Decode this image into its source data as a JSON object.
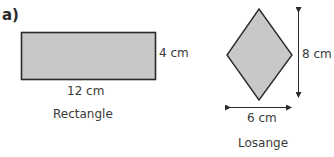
{
  "part_label": "a)",
  "colors": {
    "fill": "#c8c8c8",
    "stroke": "#2b2b2b",
    "text": "#3a3a3a"
  },
  "rectangle": {
    "name": "Rectangle",
    "width_label": "12 cm",
    "height_label": "4 cm"
  },
  "rhombus": {
    "name": "Losange",
    "width_label": "6 cm",
    "height_label": "8 cm"
  }
}
